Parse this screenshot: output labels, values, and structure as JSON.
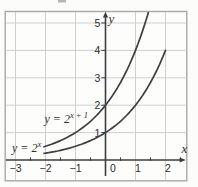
{
  "figure": {
    "background": "#fcfcfb",
    "frame_color": "#a8a8a8",
    "grid_color": "#cfcfcf",
    "axis_color": "#3d3d3d",
    "curve_color": "#3f3f3f",
    "text_color": "#2e2e2e"
  },
  "chart_data": {
    "type": "line",
    "title": "",
    "xlabel": "x",
    "ylabel": "y",
    "xlim": [
      -3.35,
      2.72
    ],
    "ylim": [
      -0.77,
      5.42
    ],
    "grid": true,
    "x_tick_values": [
      -3,
      -2,
      -1,
      0,
      1,
      2
    ],
    "x_tick_labels": [
      "−3",
      "−2",
      "−1",
      "0",
      "1",
      "2"
    ],
    "x_minor_ticks": [
      -2.5,
      -1.5,
      -0.5,
      0.5,
      1.5,
      2.5
    ],
    "y_tick_values": [
      1,
      2,
      3,
      4,
      5
    ],
    "y_tick_labels": [
      "1",
      "2",
      "3",
      "4",
      "5"
    ],
    "origin_label": "0",
    "legend_position": "on-curve-labels",
    "series": [
      {
        "name": "y-equals-2-to-the-x",
        "label_base": "y = 2",
        "label_exponent": "x",
        "key_points": [
          [
            -2,
            0.25
          ],
          [
            -1,
            0.5
          ],
          [
            0,
            1
          ],
          [
            1,
            2
          ],
          [
            2,
            4
          ]
        ],
        "points": [
          [
            -2.05,
            0.2415
          ],
          [
            -2.0,
            0.25
          ],
          [
            -1.9,
            0.2679
          ],
          [
            -1.8,
            0.2872
          ],
          [
            -1.7,
            0.3078
          ],
          [
            -1.6,
            0.3299
          ],
          [
            -1.5,
            0.3536
          ],
          [
            -1.4,
            0.3789
          ],
          [
            -1.3,
            0.4061
          ],
          [
            -1.2,
            0.4353
          ],
          [
            -1.1,
            0.4665
          ],
          [
            -1.0,
            0.5
          ],
          [
            -0.9,
            0.5359
          ],
          [
            -0.8,
            0.5743
          ],
          [
            -0.7,
            0.6156
          ],
          [
            -0.6,
            0.6598
          ],
          [
            -0.5,
            0.7071
          ],
          [
            -0.4,
            0.7579
          ],
          [
            -0.3,
            0.8123
          ],
          [
            -0.2,
            0.8706
          ],
          [
            -0.1,
            0.933
          ],
          [
            0.0,
            1.0
          ],
          [
            0.1,
            1.0718
          ],
          [
            0.2,
            1.1487
          ],
          [
            0.3,
            1.2311
          ],
          [
            0.4,
            1.3195
          ],
          [
            0.5,
            1.4142
          ],
          [
            0.6,
            1.5157
          ],
          [
            0.7,
            1.6245
          ],
          [
            0.8,
            1.7411
          ],
          [
            0.9,
            1.8661
          ],
          [
            1.0,
            2.0
          ],
          [
            1.1,
            2.1435
          ],
          [
            1.2,
            2.2974
          ],
          [
            1.3,
            2.4623
          ],
          [
            1.4,
            2.639
          ],
          [
            1.5,
            2.8284
          ],
          [
            1.6,
            3.0314
          ],
          [
            1.7,
            3.249
          ],
          [
            1.8,
            3.4822
          ],
          [
            1.9,
            3.7321
          ],
          [
            2.0,
            4.0
          ]
        ]
      },
      {
        "name": "y-equals-2-to-the-x-plus-1",
        "label_base": "y = 2",
        "label_exponent": "x + 1",
        "key_points": [
          [
            -2,
            0.5
          ],
          [
            -1,
            1
          ],
          [
            0,
            2
          ],
          [
            1,
            4
          ]
        ],
        "points": [
          [
            -2.05,
            0.483
          ],
          [
            -2.0,
            0.5
          ],
          [
            -1.9,
            0.5359
          ],
          [
            -1.8,
            0.5743
          ],
          [
            -1.7,
            0.6156
          ],
          [
            -1.6,
            0.6598
          ],
          [
            -1.5,
            0.7071
          ],
          [
            -1.4,
            0.7579
          ],
          [
            -1.3,
            0.8123
          ],
          [
            -1.2,
            0.8706
          ],
          [
            -1.1,
            0.933
          ],
          [
            -1.0,
            1.0
          ],
          [
            -0.9,
            1.0718
          ],
          [
            -0.8,
            1.1487
          ],
          [
            -0.7,
            1.2311
          ],
          [
            -0.6,
            1.3195
          ],
          [
            -0.5,
            1.4142
          ],
          [
            -0.4,
            1.5157
          ],
          [
            -0.3,
            1.6245
          ],
          [
            -0.2,
            1.7411
          ],
          [
            -0.1,
            1.8661
          ],
          [
            0.0,
            2.0
          ],
          [
            0.1,
            2.1435
          ],
          [
            0.2,
            2.2974
          ],
          [
            0.3,
            2.4623
          ],
          [
            0.4,
            2.639
          ],
          [
            0.5,
            2.8284
          ],
          [
            0.6,
            3.0314
          ],
          [
            0.7,
            3.249
          ],
          [
            0.8,
            3.4822
          ],
          [
            0.9,
            3.7321
          ],
          [
            1.0,
            4.0
          ],
          [
            1.1,
            4.287
          ],
          [
            1.2,
            4.5948
          ],
          [
            1.3,
            4.9246
          ],
          [
            1.4,
            5.278
          ],
          [
            1.5,
            5.6569
          ]
        ]
      }
    ]
  }
}
